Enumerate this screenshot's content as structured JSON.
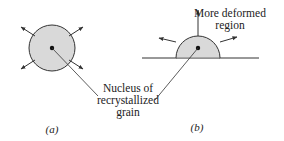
{
  "figure": {
    "colors": {
      "grain_fill": "#d9d9d9",
      "stroke": "#333333",
      "background": "#ffffff"
    },
    "panel_a": {
      "caption": "(a)",
      "shape": "circle",
      "description": "Nucleus of recrystallized grain growing inside the grain"
    },
    "panel_b": {
      "caption": "(b)",
      "shape": "semicircle-on-boundary",
      "region_label_line1": "More deformed",
      "region_label_line2": "region"
    },
    "shared_label": {
      "line1": "Nucleus of",
      "line2": "recrystallized",
      "line3": "grain"
    }
  }
}
